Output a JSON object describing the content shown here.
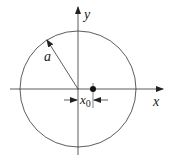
{
  "diagram": {
    "labels": {
      "x_axis": "x",
      "y_axis": "y",
      "radius": "a",
      "offset_main": "x",
      "offset_sub": "0"
    },
    "colors": {
      "stroke": "#333333",
      "background": "#ffffff"
    }
  }
}
